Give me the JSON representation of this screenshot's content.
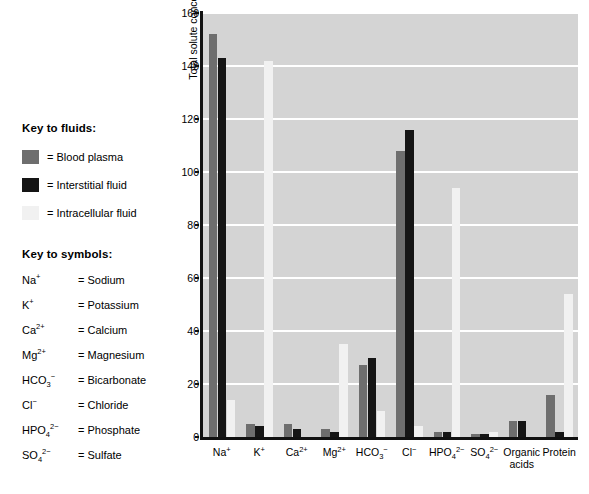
{
  "fluid_key": {
    "title": "Key to fluids:",
    "items": [
      {
        "label": "= Blood plasma",
        "color": "#6e6e6e",
        "icon": "legend-swatch"
      },
      {
        "label": "= Interstitial fluid",
        "color": "#151515",
        "icon": "legend-swatch"
      },
      {
        "label": "= Intracellular fluid",
        "color": "#f1f1f1",
        "icon": "legend-swatch"
      }
    ]
  },
  "symbol_key": {
    "title": "Key to symbols:",
    "items": [
      {
        "formula_html": "Na<sup>+</sup>",
        "name": "= Sodium"
      },
      {
        "formula_html": "K<sup>+</sup>",
        "name": "= Potassium"
      },
      {
        "formula_html": "Ca<sup>2+</sup>",
        "name": "= Calcium"
      },
      {
        "formula_html": "Mg<sup>2+</sup>",
        "name": "= Magnesium"
      },
      {
        "formula_html": "HCO<sub>3</sub><sup>&#8722;</sup>",
        "name": "= Bicarbonate"
      },
      {
        "formula_html": "Cl<sup>&#8722;</sup>",
        "name": "= Chloride"
      },
      {
        "formula_html": "HPO<sub>4</sub><sup>2&#8722;</sup>",
        "name": "= Phosphate"
      },
      {
        "formula_html": "SO<sub>4</sub><sup>2&#8722;</sup>",
        "name": "= Sulfate"
      }
    ]
  },
  "chart_data": {
    "type": "bar",
    "title": "",
    "xlabel": "",
    "ylabel": "Total solute concentration (mEq/L)",
    "ylim": [
      0,
      160
    ],
    "yticks": [
      0,
      20,
      40,
      60,
      80,
      100,
      120,
      140,
      160
    ],
    "grid": true,
    "legend_position": "left-outside",
    "categories": [
      "Na+",
      "K+",
      "Ca2+",
      "Mg2+",
      "HCO3-",
      "Cl-",
      "HPO4 2-",
      "SO4 2-",
      "Organic acids",
      "Protein"
    ],
    "category_labels_html": [
      "Na<sup>+</sup>",
      "K<sup>+</sup>",
      "Ca<sup>2+</sup>",
      "Mg<sup>2+</sup>",
      "HCO<sub>3</sub><sup>&#8722;</sup>",
      "Cl<sup>&#8722;</sup>",
      "HPO<sub>4</sub><sup>2&#8722;</sup>",
      "SO<sub>4</sub><sup>2&#8722;</sup>",
      "Organic<br>acids",
      "Protein"
    ],
    "series": [
      {
        "name": "Blood plasma",
        "color": "#6e6e6e",
        "values": [
          152,
          5,
          5,
          3,
          27,
          108,
          2,
          1,
          6,
          16
        ]
      },
      {
        "name": "Interstitial fluid",
        "color": "#151515",
        "values": [
          143,
          4,
          3,
          2,
          30,
          116,
          2,
          1,
          6,
          2
        ]
      },
      {
        "name": "Intracellular fluid",
        "color": "#f1f1f1",
        "values": [
          14,
          142,
          0,
          35,
          10,
          4,
          94,
          2,
          0,
          54
        ]
      }
    ]
  }
}
